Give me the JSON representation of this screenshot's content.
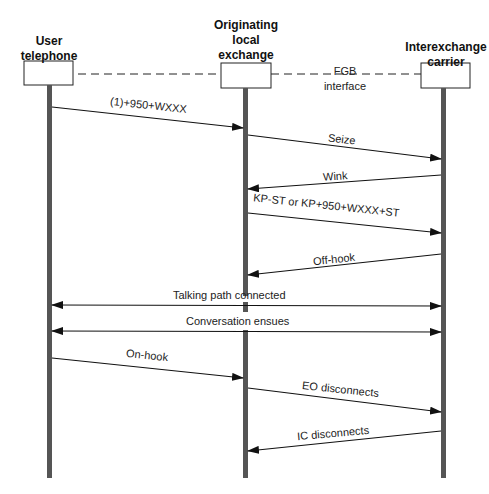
{
  "diagram": {
    "type": "sequence",
    "participants": [
      {
        "id": "user",
        "label_lines": [
          "User",
          "telephone"
        ]
      },
      {
        "id": "lec",
        "label_lines": [
          "Originating",
          "local",
          "exchange"
        ]
      },
      {
        "id": "ixc",
        "label_lines": [
          "Interexchange",
          "carrier"
        ]
      }
    ],
    "interface": {
      "label_lines": [
        "FGB",
        "interface"
      ]
    },
    "messages": [
      {
        "from": "user",
        "to": "lec",
        "label": "(1)+950+WXXX"
      },
      {
        "from": "lec",
        "to": "ixc",
        "label": "Seize"
      },
      {
        "from": "ixc",
        "to": "lec",
        "label": "Wink"
      },
      {
        "from": "lec",
        "to": "ixc",
        "label": "KP-ST or KP+950+WXXX+ST"
      },
      {
        "from": "ixc",
        "to": "lec",
        "label": "Off-hook"
      },
      {
        "from": "user",
        "to": "ixc",
        "label": "Talking path connected",
        "bidirectional": true
      },
      {
        "from": "user",
        "to": "ixc",
        "label": "Conversation ensues",
        "bidirectional": true
      },
      {
        "from": "user",
        "to": "lec",
        "label": "On-hook"
      },
      {
        "from": "lec",
        "to": "ixc",
        "label": "EO disconnects"
      },
      {
        "from": "ixc",
        "to": "lec",
        "label": "IC disconnects"
      }
    ]
  }
}
